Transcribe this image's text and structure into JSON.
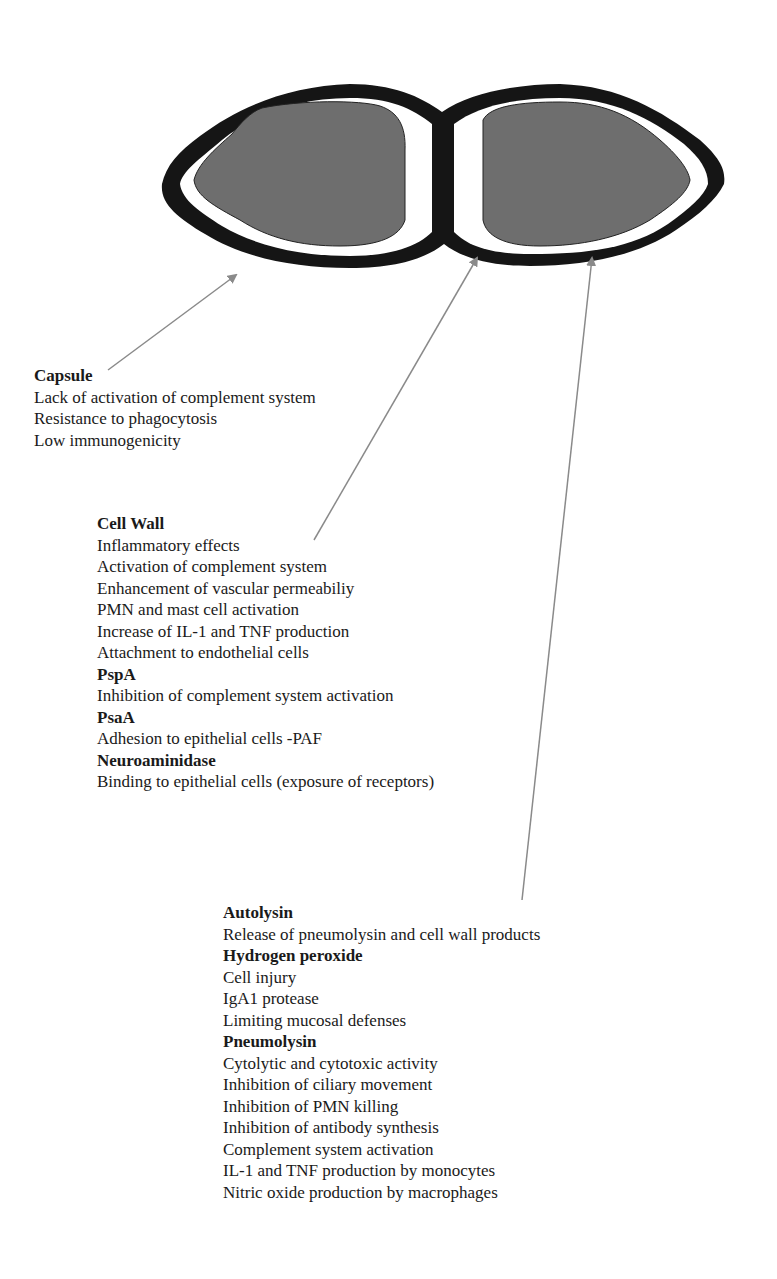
{
  "diagram": {
    "cell": {
      "shape": "diplococcus",
      "capsule_color": "#151515",
      "gap_color": "#ffffff",
      "cytoplasm_color": "#6e6e6e",
      "arrow_color": "#8a8a8a"
    },
    "capsule": {
      "title": "Capsule",
      "items": [
        "Lack of activation of complement system",
        "Resistance to phagocytosis",
        "Low immunogenicity"
      ]
    },
    "cell_wall_group": {
      "sections": [
        {
          "title": "Cell Wall",
          "items": [
            "Inflammatory effects",
            "Activation of complement system",
            "Enhancement of vascular permeabiliy",
            "PMN and mast cell activation",
            "Increase of IL-1 and TNF production",
            "Attachment to endothelial cells"
          ]
        },
        {
          "title": "PspA",
          "items": [
            "Inhibition of complement system activation"
          ]
        },
        {
          "title": "PsaA",
          "items": [
            "Adhesion to epithelial cells -PAF"
          ]
        },
        {
          "title": "Neuroaminidase",
          "items": [
            "Binding to epithelial cells (exposure of receptors)"
          ]
        }
      ]
    },
    "intracellular_group": {
      "sections": [
        {
          "title": "Autolysin",
          "items": [
            "Release of pneumolysin and cell wall products"
          ]
        },
        {
          "title": "Hydrogen peroxide",
          "items": [
            "Cell injury",
            "IgA1 protease",
            "Limiting mucosal defenses"
          ]
        },
        {
          "title": "Pneumolysin",
          "items": [
            "Cytolytic and cytotoxic activity",
            "Inhibition of ciliary movement",
            "Inhibition of PMN killing",
            "Inhibition of antibody synthesis",
            "Complement system activation",
            "IL-1 and TNF production by monocytes",
            "Nitric oxide production by macrophages"
          ]
        }
      ]
    }
  }
}
